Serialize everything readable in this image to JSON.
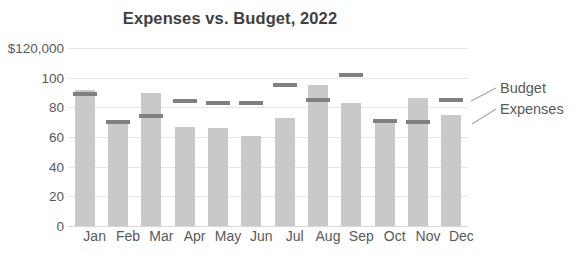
{
  "chart_data": {
    "type": "bar",
    "title": "Expenses vs. Budget, 2022",
    "xlabel": "",
    "ylabel": "",
    "ylim": [
      0,
      120
    ],
    "grid": true,
    "legend_position": "right-callout",
    "categories": [
      "Jan",
      "Feb",
      "Mar",
      "Apr",
      "May",
      "Jun",
      "Jul",
      "Aug",
      "Sep",
      "Oct",
      "Nov",
      "Dec"
    ],
    "ytick_labels": [
      "$120,000",
      "100",
      "80",
      "60",
      "40",
      "20",
      "0"
    ],
    "ytick_values": [
      120,
      100,
      80,
      60,
      40,
      20,
      0
    ],
    "series": [
      {
        "name": "Expenses",
        "type": "bar",
        "color": "#c9c9c9",
        "values": [
          92,
          70,
          90,
          67,
          66,
          61,
          73,
          95,
          83,
          72,
          86,
          75
        ]
      },
      {
        "name": "Budget",
        "type": "marker",
        "color": "#808080",
        "values": [
          89,
          70,
          74,
          84,
          83,
          83,
          95,
          85,
          102,
          71,
          70,
          85
        ]
      }
    ],
    "annotations": [
      {
        "name": "budget-callout",
        "text": "Budget"
      },
      {
        "name": "expenses-callout",
        "text": "Expenses"
      }
    ]
  },
  "legend": {
    "budget_label": "Budget",
    "expenses_label": "Expenses"
  },
  "colors": {
    "bar": "#c9c9c9",
    "marker": "#808080",
    "grid": "#e6e6e6",
    "text": "#595959",
    "title": "#3f3f3f"
  }
}
